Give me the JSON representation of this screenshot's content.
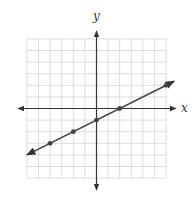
{
  "graph": {
    "axis_labels": {
      "x": "x",
      "y": "y"
    },
    "grid": {
      "xmin": -6,
      "xmax": 6,
      "ymin": -6,
      "ymax": 6,
      "step": 1
    },
    "colors": {
      "grid": "#d4d4d4",
      "axis": "#333333",
      "line": "#444444",
      "point": "#444444"
    },
    "line": {
      "slope": 0.5,
      "intercept": -1,
      "x_start": -6,
      "x_end": 6.7
    },
    "points": [
      {
        "x": -4,
        "y": -3
      },
      {
        "x": -2,
        "y": -2
      },
      {
        "x": 0,
        "y": -1
      },
      {
        "x": 2,
        "y": 0
      },
      {
        "x": 6,
        "y": 2
      }
    ]
  },
  "chart_data": {
    "type": "line",
    "title": "",
    "xlabel": "x",
    "ylabel": "y",
    "xlim": [
      -6,
      6
    ],
    "ylim": [
      -6,
      6
    ],
    "grid": true,
    "equation": "y = (1/2)x - 1",
    "x": [
      -4,
      -2,
      0,
      2,
      6
    ],
    "values": [
      -3,
      -2,
      -1,
      0,
      2
    ]
  }
}
